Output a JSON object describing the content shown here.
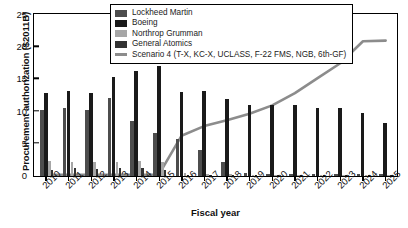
{
  "chart_data": {
    "type": "bar",
    "title": "",
    "xlabel": "Fiscal year",
    "ylabel": "Procurement authorization ($2011B)",
    "ylim": [
      0,
      25
    ],
    "yticks": [
      0,
      5,
      10,
      15,
      20,
      25
    ],
    "grid": false,
    "legend_position": "top-center",
    "categories": [
      "2010",
      "2011",
      "2012",
      "2013",
      "2014",
      "2015",
      "2016",
      "2017",
      "2018",
      "2019",
      "2020",
      "2021",
      "2022",
      "2023",
      "2024",
      "2025"
    ],
    "series": [
      {
        "name": "Lockheed Martin",
        "color": "#4d4d4d",
        "type": "bar",
        "values": [
          10.3,
          10.5,
          10.3,
          12.1,
          8.6,
          6.7,
          5.7,
          4.1,
          2.2,
          0.4,
          0.3,
          0.3,
          0.3,
          0.3,
          0.3,
          0.3
        ]
      },
      {
        "name": "Boeing",
        "color": "#1a1a1a",
        "type": "bar",
        "values": [
          12.9,
          13.2,
          12.8,
          15.3,
          16.3,
          17.0,
          13.1,
          13.2,
          12.0,
          11.0,
          11.0,
          11.0,
          10.5,
          10.5,
          9.7,
          8.2
        ]
      },
      {
        "name": "Northrop Grumman",
        "color": "#a6a6a6",
        "type": "bar",
        "values": [
          2.3,
          2.2,
          2.1,
          2.1,
          2.3,
          2.2,
          0.4,
          0.3,
          0.3,
          0.2,
          0.2,
          0.2,
          0.2,
          0.2,
          0.2,
          0.2
        ]
      },
      {
        "name": "General Atomics",
        "color": "#333333",
        "type": "bar",
        "values": [
          1.0,
          1.2,
          1.1,
          1.2,
          1.3,
          0.9,
          0.2,
          0.2,
          0.2,
          0.1,
          0.1,
          0.1,
          0.1,
          0.1,
          0.1,
          0.1
        ]
      },
      {
        "name": "Scenario 4 (T-X, KC-X, UCLASS, F-22 FMS, NGB, 6th-GF)",
        "color": "#8c8c8c",
        "type": "line",
        "values": [
          0.2,
          0.2,
          0.2,
          0.2,
          0.2,
          0.2,
          6.2,
          7.7,
          8.6,
          9.6,
          10.9,
          12.8,
          15.1,
          17.4,
          20.8,
          20.9
        ]
      }
    ]
  },
  "legend": {
    "items": [
      {
        "label": "Lockheed Martin",
        "swatch": "#4d4d4d",
        "kind": "box"
      },
      {
        "label": "Boeing",
        "swatch": "#1a1a1a",
        "kind": "box"
      },
      {
        "label": "Northrop Grumman",
        "swatch": "#a6a6a6",
        "kind": "box"
      },
      {
        "label": "General Atomics",
        "swatch": "#333333",
        "kind": "box"
      },
      {
        "label": "Scenario 4 (T-X, KC-X, UCLASS, F-22 FMS, NGB, 6th-GF)",
        "swatch": "#8c8c8c",
        "kind": "line"
      }
    ]
  }
}
